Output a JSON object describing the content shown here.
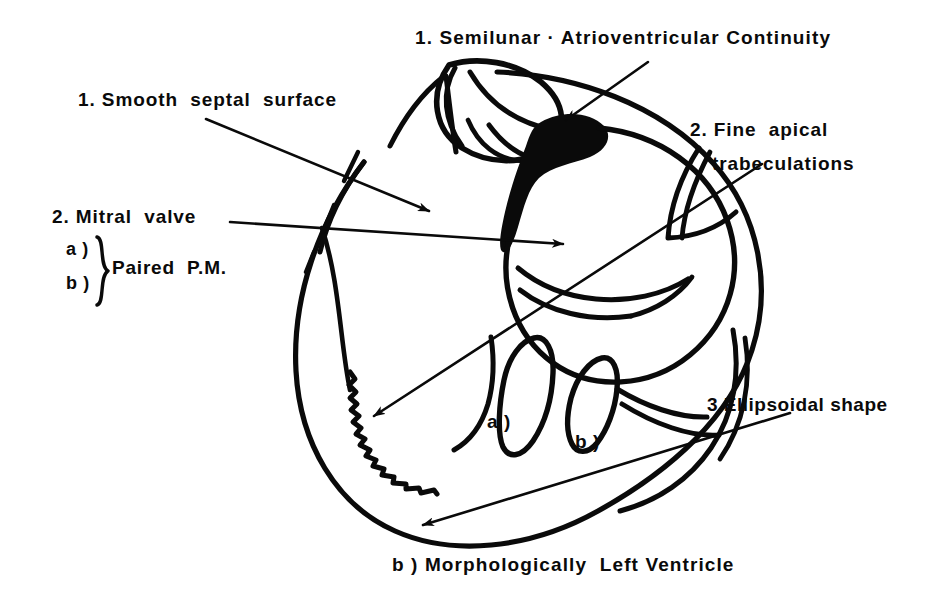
{
  "figure": {
    "title": "Morphologically Left Ventricle",
    "kind": "anatomical-line-drawing",
    "caption": "b ) Morphologically  Left Ventricle",
    "background_color": "#ffffff",
    "ink_color": "#0a0a0a"
  },
  "annotations": {
    "semilunar_continuity": "1. Semilunar · Atrioventricular Continuity",
    "smooth_septal_surface": "1. Smooth  septal  surface",
    "mitral_valve": "2. Mitral  valve",
    "pm_a": "a )",
    "pm_b": "b )",
    "paired_pm": "Paired  P.M.",
    "fine_apical_line1": "2. Fine  apical",
    "fine_apical_line2": "trabeculations",
    "ellipsoidal_shape": "3.Ellipsoidal shape",
    "papillary_a": "a )",
    "papillary_b": "b )"
  },
  "arrows": [
    {
      "name": "arrow-semilunar-continuity",
      "label": "1. Semilunar · Atrioventricular Continuity",
      "from": [
        648,
        62
      ],
      "to": [
        562,
        123
      ],
      "points_at": "aortic-mitral fibrous continuity"
    },
    {
      "name": "arrow-smooth-septal-surface",
      "label": "1. Smooth  septal  surface",
      "from": [
        206,
        119
      ],
      "to": [
        432,
        213
      ],
      "points_at": "smooth septal surface"
    },
    {
      "name": "arrow-mitral-valve",
      "label": "2. Mitral  valve",
      "from": [
        230,
        222
      ],
      "to": [
        566,
        245
      ],
      "points_at": "mitral valve leaflet"
    },
    {
      "name": "arrow-fine-apical-trabeculations",
      "label": "2. Fine  apical trabeculations",
      "from": [
        762,
        164
      ],
      "to": [
        370,
        419
      ],
      "points_at": "fine apical trabeculations"
    },
    {
      "name": "arrow-ellipsoidal-shape",
      "label": "3.Ellipsoidal shape",
      "from": [
        790,
        413
      ],
      "to": [
        418,
        527
      ],
      "points_at": "ellipsoidal ventricular outline"
    }
  ],
  "structures": [
    {
      "name": "ventricular-outline",
      "description": "ellipsoidal left ventricular cavity outline"
    },
    {
      "name": "semilunar-valve",
      "description": "aortic (semilunar) valve with three cusps"
    },
    {
      "name": "fibrous-continuity",
      "description": "solid black aortic-mitral fibrous continuity"
    },
    {
      "name": "mitral-valve",
      "description": "mitral valve leaflets"
    },
    {
      "name": "papillary-muscle-a",
      "description": "anterolateral papillary muscle"
    },
    {
      "name": "papillary-muscle-b",
      "description": "posteromedial papillary muscle"
    },
    {
      "name": "apical-trabeculations",
      "description": "fine serrated apical trabeculations"
    },
    {
      "name": "septal-surface",
      "description": "smooth septal surface shown as broken lines"
    }
  ]
}
